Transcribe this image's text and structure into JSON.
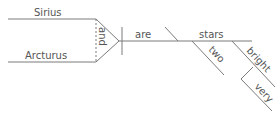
{
  "diagram": {
    "type": "sentence-diagram",
    "subjects": [
      "Sirius",
      "Arcturus"
    ],
    "conjunction": "and",
    "verb": "are",
    "predicate_nominative": "stars",
    "modifiers": {
      "two": "two",
      "bright": "bright",
      "very": "very"
    },
    "colors": {
      "line": "#7a7a7a",
      "text": "#555555",
      "background": "#ffffff"
    }
  }
}
